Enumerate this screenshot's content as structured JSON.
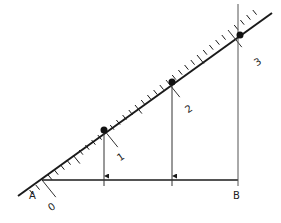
{
  "diagram": {
    "colors": {
      "stroke": "#1a1a1a",
      "thin": "#555555"
    },
    "points": {
      "A": {
        "label": "A",
        "x": 42,
        "y": 180
      },
      "B": {
        "label": "B",
        "x": 238,
        "y": 180
      }
    },
    "scale_labels": [
      "0",
      "1",
      "2",
      "3"
    ],
    "projected_points": [
      {
        "id": "1",
        "x": 104,
        "y": 130
      },
      {
        "id": "2",
        "x": 172,
        "y": 82
      },
      {
        "id": "3",
        "x": 240,
        "y": 35
      }
    ]
  }
}
